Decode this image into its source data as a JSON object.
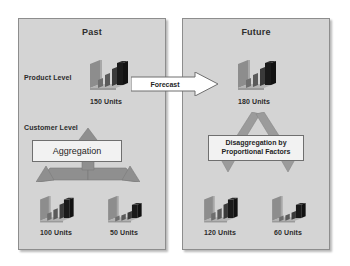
{
  "diagram": {
    "colors": {
      "panel_fill": "#d4d4d4",
      "panel_border": "#8d8d8d",
      "arrow_gray": "#8f8f8f",
      "callout_fill": "#f2f2f2",
      "callout_border": "#6f6f6f",
      "text": "#2b2b2b",
      "bar_dark": "#1a1a1a",
      "bar_mid": "#6e6e6e",
      "bar_light": "#a8a8a8"
    },
    "panels": [
      {
        "id": "past",
        "title": "Past",
        "labels": [
          {
            "name": "product-level",
            "text": "Product Level"
          },
          {
            "name": "customer-level",
            "text": "Customer Level"
          }
        ],
        "callout": "Aggregation",
        "nodes": [
          {
            "name": "past-product-total",
            "units": "150 Units"
          },
          {
            "name": "past-customer-a",
            "units": "100 Units"
          },
          {
            "name": "past-customer-b",
            "units": "50 Units"
          }
        ]
      },
      {
        "id": "future",
        "title": "Future",
        "labels": [],
        "callout_line1": "Disaggregation by",
        "callout_line2": "Proportional Factors",
        "nodes": [
          {
            "name": "future-product-total",
            "units": "180 Units"
          },
          {
            "name": "future-customer-a",
            "units": "120 Units"
          },
          {
            "name": "future-customer-b",
            "units": "60 Units"
          }
        ]
      }
    ],
    "transition": {
      "name": "forecast-arrow",
      "label": "Forecast"
    },
    "icons": {
      "chart": "bar-chart-3d-icon",
      "arrow_right": "arrow-right-icon",
      "arrow_up_merge": "arrow-merge-up-icon",
      "arrow_down_split": "arrow-split-down-icon"
    }
  }
}
